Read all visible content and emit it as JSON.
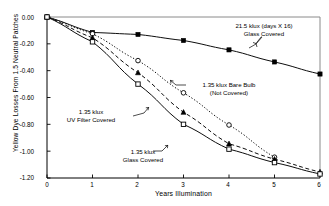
{
  "chart_data": {
    "type": "line",
    "title": "",
    "xlabel": "Years Illumination",
    "ylabel": "Yellow Dye Losses From 1.5 Neutral Patches",
    "xlim": [
      0,
      6
    ],
    "ylim": [
      -1.2,
      0.0
    ],
    "xticks": [
      "0",
      "1",
      "2",
      "3",
      "4",
      "5",
      "6"
    ],
    "xtick_values": [
      0,
      1,
      2,
      3,
      4,
      5,
      6
    ],
    "yticks": [
      "0.00",
      "-0.20",
      "-0.40",
      "-0.60",
      "-0.80",
      "-1.00",
      "-1.20"
    ],
    "ytick_values": [
      0.0,
      -0.2,
      -0.4,
      -0.6,
      -0.8,
      -1.0,
      -1.2
    ],
    "grid": false,
    "legend": "annotations-inline",
    "series": [
      {
        "name": "21.5 klux (days X 16) Glass Covered",
        "marker": "filled-square",
        "line": "solid",
        "x": [
          0,
          1,
          2,
          3,
          4,
          5,
          6
        ],
        "values": [
          0.0,
          -0.115,
          -0.13,
          -0.175,
          -0.245,
          -0.335,
          -0.425
        ]
      },
      {
        "name": "1.35 klux Bare Bulb (Not Covered)",
        "marker": "open-circle",
        "line": "dotted",
        "x": [
          0,
          1,
          2,
          3,
          4,
          5
        ],
        "values": [
          0.0,
          -0.125,
          -0.325,
          -0.565,
          -0.805,
          -1.045
        ]
      },
      {
        "name": "1.35 klux UV Filter Covered",
        "marker": "filled-triangle",
        "line": "dashed",
        "x": [
          0,
          1,
          2,
          3,
          4,
          5,
          6
        ],
        "values": [
          0.0,
          -0.155,
          -0.415,
          -0.71,
          -0.945,
          -1.06,
          -1.155
        ]
      },
      {
        "name": "1.35 klux Glass Covered",
        "marker": "open-square",
        "line": "solid",
        "x": [
          0,
          1,
          2,
          3,
          4,
          5,
          6
        ],
        "values": [
          0.0,
          -0.185,
          -0.5,
          -0.8,
          -0.985,
          -1.085,
          -1.17
        ]
      }
    ],
    "annotations": [
      {
        "text_line1": "21.5 klux (days X 16)",
        "text_line2": "Glass Covered"
      },
      {
        "text_line1": "1.35 klux Bare Bulb",
        "text_line2": "(Not Covered)"
      },
      {
        "text_line1": "1.35 klux",
        "text_line2": "UV Filter Covered"
      },
      {
        "text_line1": "1.35 klux",
        "text_line2": "Glass Covered"
      }
    ],
    "colors": {
      "line": "#000000",
      "frame": "#808080",
      "text": "#000000"
    }
  }
}
